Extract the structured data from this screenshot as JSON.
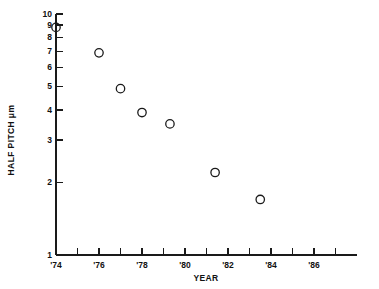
{
  "chart_data": {
    "type": "scatter",
    "title": "",
    "xlabel": "YEAR",
    "ylabel": "HALF PITCH  μm",
    "yscale": "log",
    "xscale": "linear",
    "xlim": [
      1974,
      1988
    ],
    "ylim": [
      1,
      10
    ],
    "grid": false,
    "legend": null,
    "marker_style": "open-circle",
    "x": [
      1974,
      1976,
      1977,
      1978,
      1979.3,
      1981.4,
      1983.5
    ],
    "values": [
      8.8,
      6.9,
      4.9,
      3.9,
      3.5,
      2.2,
      1.7
    ],
    "points": [
      {
        "x": 1974,
        "y": 8.8
      },
      {
        "x": 1976,
        "y": 6.9
      },
      {
        "x": 1977,
        "y": 4.9
      },
      {
        "x": 1978,
        "y": 3.9
      },
      {
        "x": 1979.3,
        "y": 3.5
      },
      {
        "x": 1981.4,
        "y": 2.2
      },
      {
        "x": 1983.5,
        "y": 1.7
      }
    ],
    "ytick_values": [
      1,
      2,
      3,
      4,
      5,
      6,
      7,
      8,
      9,
      10
    ],
    "ytick_labels": [
      "1",
      "2",
      "3",
      "4",
      "5",
      "6",
      "7",
      "8",
      "9",
      "10"
    ],
    "xtick_values": [
      1974,
      1975,
      1976,
      1977,
      1978,
      1979,
      1980,
      1981,
      1982,
      1983,
      1984,
      1985,
      1986,
      1987
    ],
    "xtick_labels": [
      "'74",
      "",
      "'76",
      "",
      "'78",
      "",
      "'80",
      "",
      "'82",
      "",
      "'84",
      "",
      "'86",
      ""
    ],
    "xtick_labeled_values": [
      1974,
      1976,
      1978,
      1980,
      1982,
      1984,
      1986
    ],
    "xtick_labeled_text": [
      "'74",
      "'76",
      "'78",
      "'80",
      "'82",
      "'84",
      "'86"
    ],
    "colors": {
      "axis": "#1a1a1a",
      "marker_stroke": "#1a1a1a",
      "text": "#111111",
      "background": "#ffffff"
    }
  }
}
